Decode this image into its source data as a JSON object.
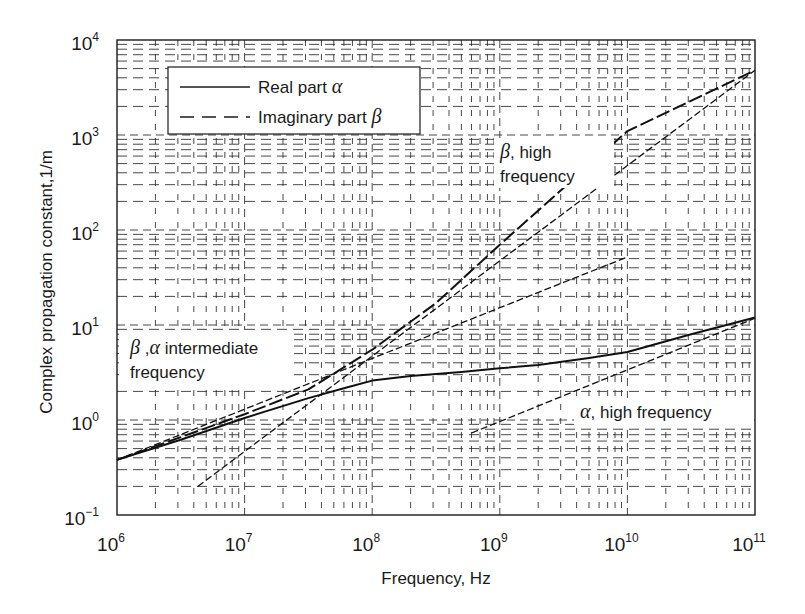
{
  "chart_data": {
    "type": "line",
    "title": "",
    "xlabel": "Frequency, Hz",
    "ylabel": "Complex propagation constant,1/m",
    "xscale": "log",
    "yscale": "log",
    "xlim": [
      1000000.0,
      100000000000.0
    ],
    "ylim": [
      0.1,
      10000
    ],
    "x_ticks": [
      {
        "base": "10",
        "exp": "6"
      },
      {
        "base": "10",
        "exp": "7"
      },
      {
        "base": "10",
        "exp": "8"
      },
      {
        "base": "10",
        "exp": "9"
      },
      {
        "base": "10",
        "exp": "10"
      },
      {
        "base": "10",
        "exp": "11"
      }
    ],
    "y_ticks": [
      {
        "base": "10",
        "exp": "−1"
      },
      {
        "base": "10",
        "exp": "0"
      },
      {
        "base": "10",
        "exp": "1"
      },
      {
        "base": "10",
        "exp": "2"
      },
      {
        "base": "10",
        "exp": "3"
      },
      {
        "base": "10",
        "exp": "4"
      }
    ],
    "grid": true,
    "grid_style": "dashed major and minor log gridlines",
    "legend": {
      "position": "upper left",
      "entries": [
        {
          "label": "Real part",
          "symbol": "α",
          "style": "solid"
        },
        {
          "label": "Imaginary part",
          "symbol": "β",
          "style": "dashed"
        }
      ]
    },
    "series": [
      {
        "name": "Real part α",
        "style": "solid",
        "x": [
          1000000.0,
          3160000.0,
          10000000.0,
          31600000.0,
          63000000.0,
          100000000.0,
          200000000.0,
          500000000.0,
          1000000000.0,
          2000000000.0,
          5000000000.0,
          10000000000.0,
          31600000000.0,
          100000000000.0
        ],
        "values": [
          0.38,
          0.62,
          1.05,
          1.7,
          2.2,
          2.6,
          2.9,
          3.2,
          3.5,
          3.8,
          4.5,
          5.2,
          8.0,
          12.0
        ]
      },
      {
        "name": "Imaginary part β",
        "style": "dashed",
        "x": [
          1000000.0,
          3160000.0,
          10000000.0,
          31600000.0,
          100000000.0,
          316000000.0,
          1000000000.0,
          10000000000.0,
          100000000000.0
        ],
        "values": [
          0.38,
          0.66,
          1.15,
          2.1,
          5.5,
          17,
          70,
          1100,
          4800
        ]
      },
      {
        "name": "β, high frequency (asymptote)",
        "style": "dashed-thin",
        "x": [
          4300000.0,
          100000000000.0
        ],
        "values": [
          0.2,
          4800
        ]
      },
      {
        "name": "β, α intermediate frequency (asymptote)",
        "style": "dashed-thin",
        "x": [
          1000000.0,
          10000000000.0
        ],
        "values": [
          0.38,
          52
        ]
      },
      {
        "name": "α, high frequency (asymptote)",
        "style": "dashed-thin",
        "x": [
          600000000.0,
          100000000000.0
        ],
        "values": [
          0.73,
          11.8
        ]
      }
    ],
    "annotations": [
      {
        "greek": "β",
        "text": ", high",
        "line2": "frequency"
      },
      {
        "greek": "β",
        "greek2": "α",
        "text": " intermediate",
        "line2": "frequency"
      },
      {
        "greek": "α",
        "text": ", high frequency"
      }
    ]
  }
}
